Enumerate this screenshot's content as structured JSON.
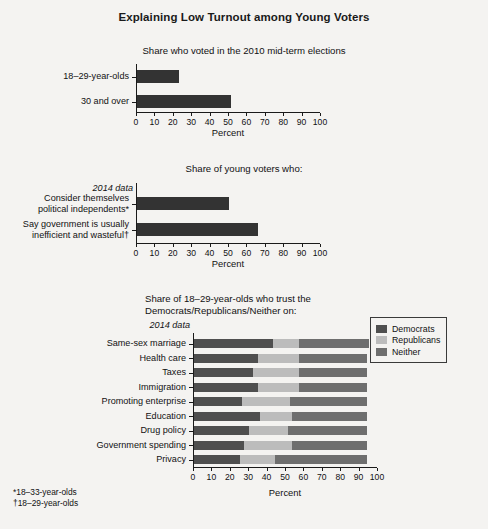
{
  "figure": {
    "title": "Explaining Low Turnout among Young Voters",
    "footnotes": [
      "*18–33-year-olds",
      "†18–29-year-olds"
    ],
    "axis_title": "Percent",
    "tick_labels": [
      "0",
      "10",
      "20",
      "30",
      "40",
      "50",
      "60",
      "70",
      "80",
      "90",
      "100"
    ]
  },
  "colors": {
    "democrats": "#4f4f4f",
    "republicans": "#bcbcbc",
    "neither": "#6e6e6e",
    "bar_solid": "#333333",
    "axis": "#1a1a1a",
    "background": "#f4f3f1"
  },
  "legend": {
    "position": "top-right",
    "items": [
      {
        "label": "Democrats",
        "color": "#4f4f4f"
      },
      {
        "label": "Republicans",
        "color": "#bcbcbc"
      },
      {
        "label": "Neither",
        "color": "#6e6e6e"
      }
    ]
  },
  "chart_data": [
    {
      "type": "bar",
      "orientation": "horizontal",
      "title": "Share who voted in the 2010 mid-term elections",
      "xlabel": "Percent",
      "ylabel": "",
      "xlim": [
        0,
        100
      ],
      "grid": false,
      "legend": "none",
      "categories": [
        "18–29-year-olds",
        "30 and over"
      ],
      "values": [
        23,
        51
      ]
    },
    {
      "type": "bar",
      "orientation": "horizontal",
      "title": "Share of young voters who:",
      "xlabel": "Percent",
      "ylabel": "",
      "xlim": [
        0,
        100
      ],
      "grid": false,
      "legend": "none",
      "note": "2014 data",
      "categories": [
        "Consider themselves\npolitical independents*",
        "Say government is usually\ninefficient and wasteful†"
      ],
      "values": [
        50,
        66
      ]
    },
    {
      "type": "bar",
      "subtype": "stacked",
      "orientation": "horizontal",
      "title": "Share of 18–29-year-olds who trust the\nDemocrats/Republicans/Neither on:",
      "xlabel": "Percent",
      "ylabel": "",
      "xlim": [
        0,
        100
      ],
      "grid": false,
      "legend": "top-right",
      "note": "2014 data",
      "categories": [
        "Same-sex marriage",
        "Health care",
        "Taxes",
        "Immigration",
        "Promoting enterprise",
        "Education",
        "Drug policy",
        "Government spending",
        "Privacy"
      ],
      "series": [
        {
          "name": "Democrats",
          "values": [
            43,
            35,
            32,
            35,
            26,
            36,
            30,
            27,
            25
          ]
        },
        {
          "name": "Republicans",
          "values": [
            14,
            22,
            25,
            22,
            26,
            17,
            21,
            26,
            19
          ]
        },
        {
          "name": "Neither",
          "values": [
            38,
            37,
            37,
            37,
            42,
            41,
            43,
            41,
            50
          ]
        }
      ]
    }
  ]
}
